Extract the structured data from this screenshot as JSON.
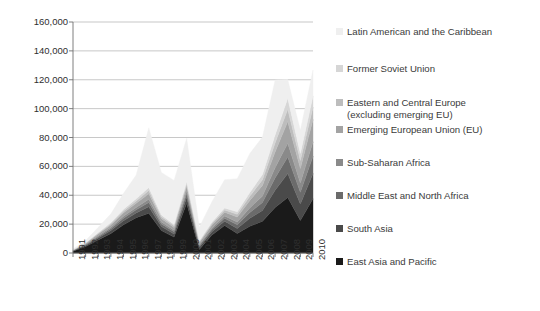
{
  "chart_data": {
    "type": "area",
    "stacked": true,
    "title": "",
    "xlabel": "",
    "ylabel": "",
    "grid": true,
    "legend_position": "right",
    "ylim": [
      0,
      160000
    ],
    "ytick_labels": [
      "160,000",
      "140,000",
      "120,000",
      "100,000",
      "80,000",
      "60,000",
      "40,000",
      "20,000",
      "0"
    ],
    "ytick_values": [
      160000,
      140000,
      120000,
      100000,
      80000,
      60000,
      40000,
      20000,
      0
    ],
    "categories": [
      "1991",
      "1992",
      "1993",
      "1994",
      "1995",
      "1996",
      "1997",
      "1998",
      "1999",
      "2000",
      "2001",
      "2002",
      "2003",
      "2004",
      "2005",
      "2006",
      "2007",
      "2008",
      "2009",
      "2010"
    ],
    "series": [
      {
        "name": "East Asia and Pacific",
        "color": "#1a1a1a",
        "values": [
          1200,
          4500,
          9000,
          13500,
          19500,
          24500,
          27500,
          15500,
          11000,
          34500,
          2500,
          12500,
          19000,
          13500,
          18500,
          22000,
          31500,
          38500,
          22500,
          37500
        ]
      },
      {
        "name": "South Asia",
        "color": "#4a4a4a",
        "values": [
          300,
          700,
          1400,
          2000,
          2800,
          3200,
          4500,
          2800,
          2200,
          4000,
          1500,
          2200,
          3000,
          3500,
          5500,
          7500,
          12000,
          16500,
          11500,
          17500
        ]
      },
      {
        "name": "Middle East and North Africa",
        "color": "#6b6b6b",
        "values": [
          200,
          500,
          900,
          1300,
          1800,
          2200,
          3000,
          1800,
          1500,
          2500,
          1000,
          1500,
          2000,
          2500,
          4000,
          5500,
          8500,
          11500,
          8000,
          12000
        ]
      },
      {
        "name": "Sub-Saharan Africa",
        "color": "#8a8a8a",
        "values": [
          150,
          350,
          700,
          1000,
          1400,
          1700,
          2300,
          1400,
          1100,
          1900,
          800,
          1200,
          1600,
          2000,
          3200,
          4500,
          7000,
          9500,
          6500,
          10000
        ]
      },
      {
        "name": "Emerging European Union (EU)",
        "color": "#a3a3a3",
        "values": [
          200,
          500,
          1100,
          1600,
          2300,
          2800,
          3800,
          2300,
          1900,
          3100,
          1300,
          2000,
          2700,
          3400,
          5200,
          7200,
          11000,
          15000,
          10000,
          15500
        ]
      },
      {
        "name": "Eastern and Central Europe\n(excluding emerging EU)",
        "color": "#bdbdbd",
        "values": [
          100,
          300,
          600,
          900,
          1300,
          1600,
          2200,
          1300,
          1100,
          1800,
          700,
          1100,
          1500,
          1900,
          2900,
          4000,
          6200,
          8500,
          5500,
          8500
        ]
      },
      {
        "name": "Former Soviet Union",
        "color": "#d6d6d6",
        "values": [
          100,
          250,
          550,
          800,
          1200,
          1500,
          2000,
          1200,
          1000,
          1700,
          600,
          1000,
          1400,
          1700,
          2600,
          3600,
          5600,
          7600,
          5000,
          7800
        ]
      },
      {
        "name": "Latin American and the Caribbean",
        "color": "#efefef",
        "values": [
          500,
          1500,
          3500,
          6000,
          11000,
          16500,
          41500,
          29500,
          30500,
          30000,
          9500,
          14000,
          19500,
          23000,
          27000,
          26000,
          38000,
          13000,
          16000,
          18000
        ]
      }
    ],
    "legend_entries": [
      {
        "label": "Latin American and the Caribbean",
        "color": "#efefef"
      },
      {
        "label": "Former Soviet Union",
        "color": "#d6d6d6"
      },
      {
        "label": "Eastern and Central Europe\n(excluding emerging EU)",
        "color": "#bdbdbd"
      },
      {
        "label": "Emerging European Union (EU)",
        "color": "#a3a3a3"
      },
      {
        "label": "Sub-Saharan Africa",
        "color": "#8a8a8a"
      },
      {
        "label": "Middle East and North Africa",
        "color": "#6b6b6b"
      },
      {
        "label": "South Asia",
        "color": "#4a4a4a"
      },
      {
        "label": "East Asia and Pacific",
        "color": "#1a1a1a"
      }
    ]
  }
}
